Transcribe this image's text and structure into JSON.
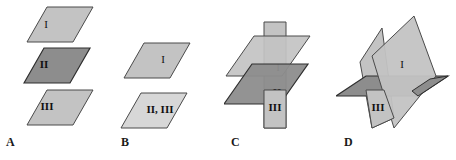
{
  "figure": {
    "background_color": "#ffffff",
    "width": 456,
    "height": 160
  },
  "colors": {
    "plane_light": "#c3c3c3",
    "plane_lighter": "#cfcfcf",
    "plane_pale": "#d7d7d7",
    "plane_dark": "#8d8d8d",
    "plane_mid": "#a9a9a9",
    "edge": "#4a4a4a",
    "edge_dark": "#2e2e2e",
    "text": "#111111",
    "label_text": "#1a1a1a"
  },
  "panels": [
    {
      "id": "panel-a",
      "label": "A",
      "label_x": 6,
      "label_y": 138,
      "description": "Three parallel planes stacked vertically",
      "planes": [
        {
          "name": "I",
          "label": "I",
          "tx": 46,
          "ty": 25,
          "fill": "#c3c3c3",
          "bold": false
        },
        {
          "name": "II",
          "label": "II",
          "tx": 43,
          "ty": 65,
          "fill": "#8d8d8d",
          "bold": true
        },
        {
          "name": "III",
          "label": "III",
          "tx": 46,
          "ty": 107,
          "fill": "#c3c3c3",
          "bold": true
        }
      ]
    },
    {
      "id": "panel-b",
      "label": "B",
      "label_x": 121,
      "label_y": 138,
      "description": "Two parallel planes, second plane shared by II and III",
      "planes": [
        {
          "name": "I",
          "label": "I",
          "tx": 163,
          "ty": 60,
          "fill": "#c3c3c3",
          "bold": false
        },
        {
          "name": "II,III",
          "label": "II, III",
          "tx": 160,
          "ty": 110,
          "fill": "#d7d7d7",
          "bold": true
        }
      ]
    },
    {
      "id": "panel-c",
      "label": "C",
      "label_x": 231,
      "label_y": 138,
      "description": "Two parallel planes cut by a third vertical plane",
      "planes": [
        {
          "name": "I",
          "label": "I",
          "tx": 278,
          "ty": 68,
          "fill": "#c3c3c3",
          "bold": false
        },
        {
          "name": "II",
          "label": "II",
          "tx": 277,
          "ty": 93,
          "fill": "#8d8d8d",
          "bold": true
        },
        {
          "name": "III",
          "label": "III",
          "tx": 261,
          "ty": 108,
          "fill": "#c3c3c3",
          "bold": true
        }
      ]
    },
    {
      "id": "panel-d",
      "label": "D",
      "label_x": 344,
      "label_y": 138,
      "description": "Three planes intersecting in a common line",
      "planes": [
        {
          "name": "I",
          "label": "I",
          "tx": 399,
          "ty": 65,
          "fill": "#c3c3c3",
          "bold": false
        },
        {
          "name": "II",
          "label": "II",
          "tx": 420,
          "ty": 89,
          "fill": "#8d8d8d",
          "bold": true
        },
        {
          "name": "III",
          "label": "III",
          "tx": 377,
          "ty": 108,
          "fill": "#c3c3c3",
          "bold": true
        }
      ]
    }
  ]
}
